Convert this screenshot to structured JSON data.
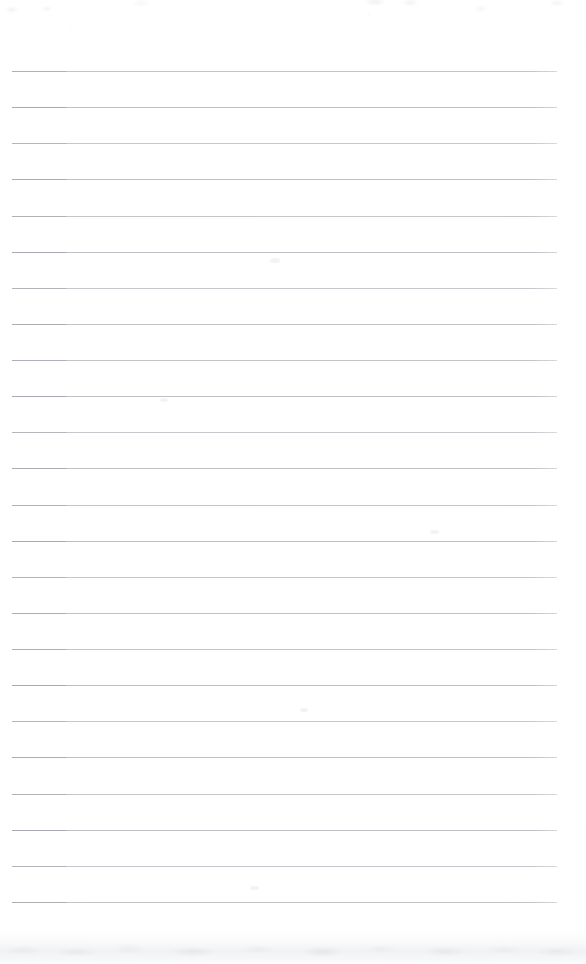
{
  "document": {
    "kind": "scanned-ruled-notebook-page",
    "title": "Blank Ruled Notebook Page",
    "page_width": 586,
    "page_height": 964,
    "paper_color": "#ffffff",
    "written_content": "",
    "text_lines": []
  },
  "ruling": {
    "line_color": "#bcc0c5",
    "line_color_dark_start": "#a7abb1",
    "line_thickness_px": 1,
    "line_left_x": 12,
    "line_right_x": 557,
    "line_width_px": 545,
    "first_line_y": 71,
    "line_spacing_px": 36.1,
    "line_count": 24,
    "line_y_positions": [
      71,
      107,
      143,
      179,
      216,
      252,
      288,
      324,
      360,
      396,
      432,
      468,
      505,
      541,
      577,
      613,
      649,
      685,
      721,
      757,
      794,
      830,
      866,
      902
    ]
  },
  "margins": {
    "top_blank_px": 71,
    "bottom_blank_px": 62,
    "left_px": 12,
    "right_px": 29
  },
  "scan_artifacts": {
    "bottom_shadow_band": {
      "present": true,
      "top_y": 930,
      "height_px": 34,
      "color": "#e8eaed"
    },
    "top_smudge_band": {
      "present": true,
      "top_y": 0,
      "height_px": 16,
      "color": "#eceef0"
    },
    "speckle_noise": {
      "present": true,
      "color": "#d6d8dc"
    },
    "blemishes": [
      {
        "x": 270,
        "y": 258,
        "w": 10,
        "h": 5
      },
      {
        "x": 160,
        "y": 398,
        "w": 8,
        "h": 4
      },
      {
        "x": 430,
        "y": 530,
        "w": 9,
        "h": 4
      },
      {
        "x": 300,
        "y": 708,
        "w": 8,
        "h": 4
      },
      {
        "x": 250,
        "y": 886,
        "w": 9,
        "h": 4
      }
    ]
  }
}
